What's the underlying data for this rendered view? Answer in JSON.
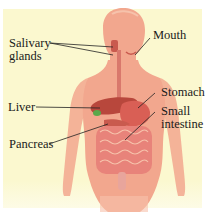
{
  "diagram": {
    "colors": {
      "background": "#fbf8cf",
      "skin": "#f2a78e",
      "skin_light": "#f6c2ab",
      "organ": "#d95f55",
      "liver": "#b8473c",
      "gallbladder": "#5aa84a",
      "intestine": "#e8837a",
      "leader_line": "#222222"
    },
    "labels": {
      "salivary_glands_line1": "Salivary",
      "salivary_glands_line2": "glands",
      "mouth": "Mouth",
      "liver": "Liver",
      "stomach": "Stomach",
      "small_intestine_line1": "Small",
      "small_intestine_line2": "intestine",
      "pancreas": "Pancreas"
    }
  }
}
